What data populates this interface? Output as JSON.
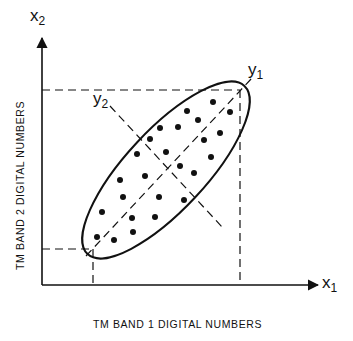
{
  "labels": {
    "x1_symbol": "x",
    "x1_sub": "1",
    "x2_symbol": "x",
    "x2_sub": "2",
    "y1_symbol": "y",
    "y1_sub": "1",
    "y2_symbol": "y",
    "y2_sub": "2",
    "x_axis_caption": "TM BAND 1  DIGITAL  NUMBERS",
    "y_axis_caption": "TM  BAND 2  DIGITAL  NUMBERS"
  },
  "colors": {
    "ink": "#111111",
    "background": "#ffffff"
  },
  "geometry": {
    "origin": [
      42,
      285
    ],
    "x_axis_end": 318,
    "y_axis_end": 38,
    "dashed_box_max": [
      240,
      90
    ],
    "dashed_box_min": [
      93,
      249
    ],
    "ellipse_center": [
      166,
      170
    ],
    "ellipse_rx": 115,
    "ellipse_ry": 40,
    "ellipse_rotation_deg": -47
  },
  "points": [
    [
      213,
      102
    ],
    [
      187,
      111
    ],
    [
      230,
      112
    ],
    [
      198,
      120
    ],
    [
      160,
      128
    ],
    [
      178,
      127
    ],
    [
      220,
      133
    ],
    [
      150,
      139
    ],
    [
      204,
      140
    ],
    [
      137,
      154
    ],
    [
      166,
      152
    ],
    [
      211,
      157
    ],
    [
      180,
      166
    ],
    [
      194,
      173
    ],
    [
      120,
      180
    ],
    [
      145,
      176
    ],
    [
      123,
      197
    ],
    [
      159,
      197
    ],
    [
      184,
      200
    ],
    [
      102,
      212
    ],
    [
      132,
      218
    ],
    [
      155,
      217
    ],
    [
      133,
      232
    ],
    [
      97,
      237
    ],
    [
      114,
      240
    ]
  ]
}
